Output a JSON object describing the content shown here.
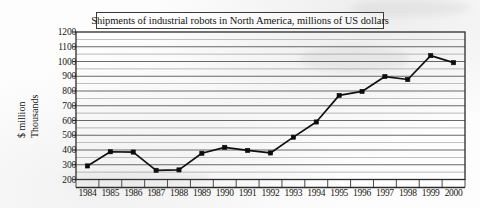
{
  "chart_data": {
    "type": "line",
    "title": "Shipments of industrial robots in North America, millions of US dollars",
    "xlabel": "",
    "ylabel_lines": [
      "$ million",
      "Thousands"
    ],
    "categories": [
      "1984",
      "1985",
      "1986",
      "1987",
      "1988",
      "1989",
      "1990",
      "1991",
      "1992",
      "1993",
      "1994",
      "1995",
      "1996",
      "1997",
      "1998",
      "1999",
      "2000"
    ],
    "values": [
      292,
      388,
      386,
      262,
      265,
      378,
      418,
      397,
      380,
      487,
      590,
      770,
      797,
      898,
      878,
      1040,
      992
    ],
    "ylim": [
      200,
      1200
    ],
    "ytick_values": [
      1200,
      1100,
      1000,
      900,
      800,
      700,
      600,
      500,
      400,
      300,
      200
    ],
    "ytick_labels": [
      "1200",
      "1100",
      "1000",
      "900",
      "800",
      "700",
      "600",
      "500",
      "400",
      "300",
      "200"
    ],
    "grid": {
      "major_step": 100,
      "minor_step": 50,
      "horizontal": true,
      "vertical_major": false
    },
    "legend": null,
    "series_name": "Shipments",
    "marker": "square",
    "line_color": "#111111",
    "marker_color": "#0d0d0d",
    "grid_color": "#8a8a8a",
    "axis_color": "#2b2b2b",
    "plot_background": "#ffffff"
  },
  "title_box": {
    "text": "Shipments of industrial robots in North America, millions of US dollars",
    "border_color": "#3a3a3a"
  },
  "axes": {
    "y_label_top": "$ million",
    "y_label_bottom": "Thousands"
  }
}
